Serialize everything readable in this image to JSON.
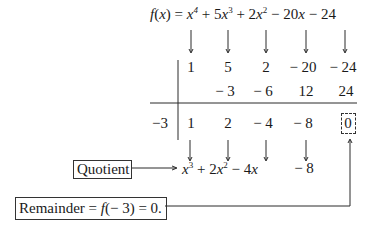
{
  "equation": {
    "lhs": "f(x) =",
    "terms": [
      {
        "coef": "",
        "var": "x",
        "exp": "4",
        "sign": ""
      },
      {
        "coef": "5",
        "var": "x",
        "exp": "3",
        "sign": "+"
      },
      {
        "coef": "2",
        "var": "x",
        "exp": "2",
        "sign": "+"
      },
      {
        "coef": "20",
        "var": "x",
        "exp": "",
        "sign": "−"
      },
      {
        "coef": "24",
        "var": "",
        "exp": "",
        "sign": "−"
      }
    ]
  },
  "divisor": "−3",
  "rows": {
    "coefficients": [
      "1",
      "5",
      "2",
      "− 20",
      "− 24"
    ],
    "products": [
      "",
      "− 3",
      "− 6",
      "12",
      "24"
    ],
    "results": [
      "1",
      "2",
      "− 4",
      "− 8",
      "0"
    ]
  },
  "quotient": {
    "label": "Quotient",
    "t1": "x",
    "t1_exp": "3",
    "t2_sign": "+ 2",
    "t2_var": "x",
    "t2_exp": "2",
    "t3_sign": "− 4",
    "t3_var": "x",
    "t4": "− 8"
  },
  "remainder": {
    "label_prefix": "Remainder = ",
    "label_func": "f",
    "label_suffix": "(− 3) = 0."
  },
  "colors": {
    "ink": "#1a1a1a",
    "background": "#ffffff"
  }
}
